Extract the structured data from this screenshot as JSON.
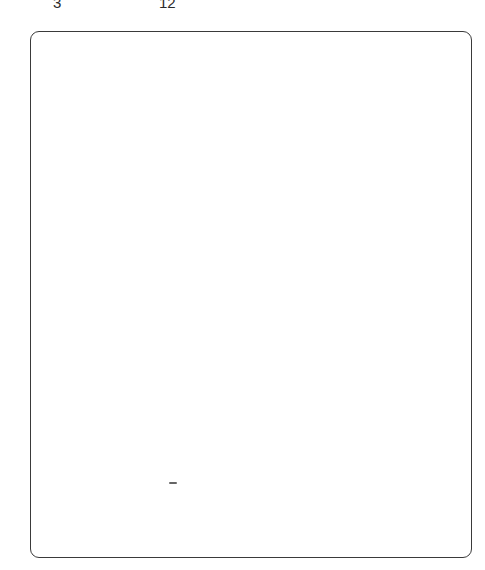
{
  "page": {
    "background_color": "#ffffff",
    "width": 485,
    "height": 570
  },
  "top_band": {
    "tokens": [
      {
        "id": "token-a",
        "leading_fragment": "—",
        "value": "3",
        "note": "character tops clipped by page edge"
      },
      {
        "id": "token-b",
        "leading_fragment": "—",
        "value": "12",
        "note": "character tops clipped by page edge"
      }
    ]
  },
  "figure": {
    "label": "",
    "content": "",
    "border_color": "#3a3a3a",
    "fill_color": "#ffffff"
  },
  "artifacts": {
    "speck": {
      "glyph": "",
      "color": "#4a4a4a"
    }
  }
}
